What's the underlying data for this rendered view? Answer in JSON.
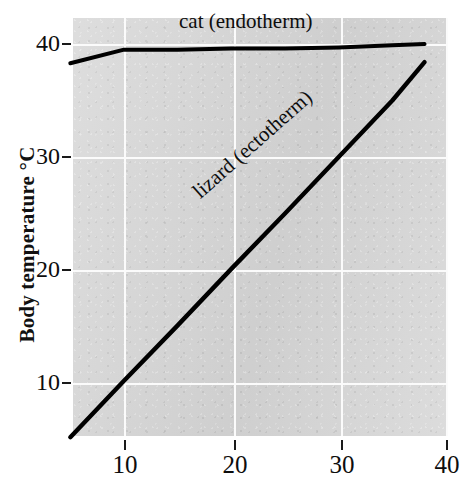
{
  "chart_data": {
    "type": "line",
    "title": "",
    "xlabel": "",
    "ylabel": "Body temperature °C",
    "xlim": [
      5,
      40
    ],
    "ylim": [
      5,
      41
    ],
    "xticks": [
      10,
      20,
      30,
      40
    ],
    "xtick_labels": [
      "10",
      "20",
      "30",
      "40"
    ],
    "yticks": [
      10,
      20,
      30,
      40
    ],
    "ytick_labels": [
      "10",
      "20",
      "30",
      "40"
    ],
    "grid": true,
    "legend_position": "inline-annotations",
    "series": [
      {
        "name": "cat (endotherm)",
        "label": "cat (endotherm)",
        "color": "#000000",
        "x": [
          5,
          10,
          15,
          20,
          25,
          30,
          35,
          38
        ],
        "values": [
          38.3,
          39.5,
          39.5,
          39.6,
          39.6,
          39.7,
          39.9,
          40.0
        ]
      },
      {
        "name": "lizard (ectotherm)",
        "label": "lizard (ectotherm)",
        "color": "#000000",
        "x": [
          5,
          10,
          15,
          20,
          25,
          30,
          35,
          38
        ],
        "values": [
          5.2,
          10.2,
          15.1,
          20.1,
          25.0,
          30.0,
          35.0,
          38.4
        ]
      }
    ],
    "annotations": [
      {
        "text": "cat (endotherm)",
        "x": 16,
        "y": 41
      },
      {
        "text": "lizard (ectotherm)",
        "x": 21,
        "y": 27
      }
    ]
  },
  "axes": {
    "y_title": "Body temperature °C",
    "y_ticks": [
      {
        "label": "40"
      },
      {
        "label": "30"
      },
      {
        "label": "20"
      },
      {
        "label": "10"
      }
    ],
    "x_ticks": [
      {
        "label": "10"
      },
      {
        "label": "20"
      },
      {
        "label": "30"
      },
      {
        "label": "40"
      }
    ]
  },
  "labels": {
    "cat": "cat (endotherm)",
    "lizard": "lizard (ectotherm)"
  },
  "colors": {
    "plot_background": "#d8d8d8",
    "gridline": "#fbfbfb",
    "line": "#000000",
    "text": "#0d0d0d",
    "page_background": "#ffffff"
  }
}
